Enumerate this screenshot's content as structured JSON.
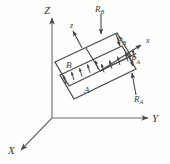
{
  "figure": {
    "kind": "engineering-free-body-diagram",
    "background_color": "#fdfdfc",
    "line_color": "#4a4a4a",
    "label_color": "#3a3a3a"
  },
  "global_axes": {
    "z_label": "Z",
    "y_label": "Y",
    "x_label": "X",
    "origin": {
      "x": 52,
      "y": 118
    }
  },
  "local_axes": {
    "z_label": "z",
    "x_label": "x"
  },
  "plates": [
    {
      "id": "plate-b",
      "label": "B"
    },
    {
      "id": "plate-a",
      "label": "A"
    }
  ],
  "forces": [
    {
      "id": "force-rb",
      "label": "R",
      "subscript": "B"
    },
    {
      "id": "force-pb",
      "label": "P",
      "subscript": "B"
    },
    {
      "id": "force-pa",
      "label": "P",
      "subscript": "A"
    },
    {
      "id": "force-ra",
      "label": "R",
      "subscript": "A"
    }
  ],
  "distributed_load": {
    "row_upper_count": 5,
    "row_lower_count": 5,
    "arrow_direction": "up-left-normal-to-plate"
  }
}
